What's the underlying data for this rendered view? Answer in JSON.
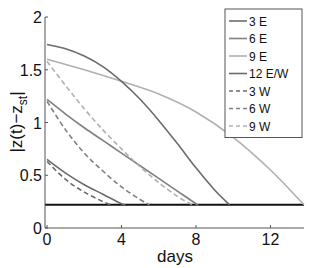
{
  "chart_data": {
    "type": "line",
    "title": "",
    "xlabel": "days",
    "ylabel": "|z(t)−z_st|",
    "ylabel_main": "|z(t)−z",
    "ylabel_sub": "st",
    "ylabel_end": "|",
    "xlim": [
      0,
      13.8
    ],
    "ylim": [
      0,
      2
    ],
    "xticks": [
      0,
      4,
      8,
      12
    ],
    "xtick_labels": [
      "0",
      "4",
      "8",
      "12"
    ],
    "yticks": [
      0,
      0.5,
      1,
      1.5,
      2
    ],
    "ytick_labels": [
      "0",
      "0.5",
      "1",
      "1.5",
      "2"
    ],
    "grid": false,
    "legend_position": "upper right",
    "baseline": {
      "y": 0.22,
      "color": "#111111"
    },
    "series": [
      {
        "name": "3 E",
        "style": "solid",
        "color": "#6b6b6b",
        "x": [
          0,
          1,
          2,
          3,
          4,
          4.2
        ],
        "y": [
          0.65,
          0.52,
          0.41,
          0.32,
          0.23,
          0.22
        ]
      },
      {
        "name": "6 E",
        "style": "solid",
        "color": "#808080",
        "x": [
          0,
          1,
          2,
          3,
          4,
          5,
          6,
          7,
          8,
          8.1
        ],
        "y": [
          1.22,
          1.08,
          0.95,
          0.83,
          0.71,
          0.59,
          0.47,
          0.35,
          0.23,
          0.22
        ]
      },
      {
        "name": "9 E",
        "style": "solid",
        "color": "#b0b0b0",
        "x": [
          0,
          2,
          4,
          6,
          8,
          10,
          12,
          13.8
        ],
        "y": [
          1.6,
          1.5,
          1.39,
          1.27,
          1.1,
          0.86,
          0.55,
          0.22
        ]
      },
      {
        "name": "12 E/W",
        "style": "solid",
        "color": "#6b6b6b",
        "x": [
          0,
          1,
          2,
          3,
          4,
          5,
          6,
          7,
          8,
          9,
          9.8
        ],
        "y": [
          1.74,
          1.7,
          1.63,
          1.53,
          1.39,
          1.22,
          1.02,
          0.8,
          0.57,
          0.36,
          0.22
        ]
      },
      {
        "name": "3 W",
        "style": "dashed",
        "color": "#6b6b6b",
        "x": [
          0,
          1,
          2,
          3,
          3.4
        ],
        "y": [
          0.63,
          0.46,
          0.34,
          0.25,
          0.22
        ]
      },
      {
        "name": "6 W",
        "style": "dashed",
        "color": "#808080",
        "x": [
          0,
          1,
          2,
          3,
          4,
          5,
          5.5
        ],
        "y": [
          1.2,
          0.93,
          0.71,
          0.54,
          0.39,
          0.27,
          0.22
        ]
      },
      {
        "name": "9 W",
        "style": "dashed",
        "color": "#b0b0b0",
        "x": [
          0,
          1,
          2,
          3,
          4,
          5,
          6,
          7,
          7.8
        ],
        "y": [
          1.58,
          1.35,
          1.13,
          0.93,
          0.75,
          0.58,
          0.43,
          0.3,
          0.22
        ]
      }
    ]
  },
  "legend": {
    "items": [
      {
        "label": "3 E",
        "style": "solid",
        "color": "#6b6b6b"
      },
      {
        "label": "6 E",
        "style": "solid",
        "color": "#808080"
      },
      {
        "label": "9 E",
        "style": "solid",
        "color": "#b0b0b0"
      },
      {
        "label": "12 E/W",
        "style": "solid",
        "color": "#6b6b6b"
      },
      {
        "label": "3 W",
        "style": "dashed",
        "color": "#6b6b6b"
      },
      {
        "label": "6 W",
        "style": "dashed",
        "color": "#808080"
      },
      {
        "label": "9 W",
        "style": "dashed",
        "color": "#b0b0b0"
      }
    ]
  }
}
